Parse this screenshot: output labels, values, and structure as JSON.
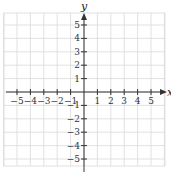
{
  "chart_data": {
    "type": "coordinate-grid",
    "title": "",
    "xlabel": "x",
    "ylabel": "y",
    "xlim": [
      -6,
      6
    ],
    "ylim": [
      -6,
      6
    ],
    "grid": true,
    "x_tick_labels": [
      "-5",
      "-4",
      "-3",
      "-2",
      "-1",
      "1",
      "2",
      "3",
      "4",
      "5"
    ],
    "y_tick_labels": [
      "5",
      "4",
      "3",
      "2",
      "1",
      "-1",
      "-2",
      "-3",
      "-4",
      "-5"
    ]
  },
  "colors": {
    "grid": "#d9d9d9",
    "axis": "#333333"
  }
}
